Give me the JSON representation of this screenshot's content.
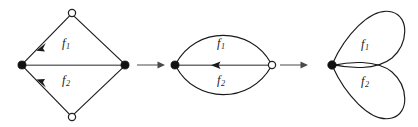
{
  "figure": {
    "caption": "",
    "background_color": "#ffffff",
    "diagrams": [
      {
        "id": "diamond-graph",
        "shape": "rhombus",
        "labels": {
          "top": "f",
          "top_sub": "1",
          "bottom": "f",
          "bottom_sub": "2"
        },
        "vertices": [
          {
            "name": "left-vertex",
            "style": "solid",
            "x": 22,
            "y": 65
          },
          {
            "name": "right-vertex",
            "style": "solid",
            "x": 125,
            "y": 65
          },
          {
            "name": "top-vertex",
            "style": "hollow",
            "x": 72,
            "y": 13
          },
          {
            "name": "bottom-vertex",
            "style": "hollow",
            "x": 72,
            "y": 117
          }
        ],
        "edges": [
          {
            "name": "edge-top-left",
            "color": "#1a1a1a",
            "arrow": "toward-left-vertex"
          },
          {
            "name": "edge-top-right",
            "color": "#1a1a1a",
            "arrow": "none"
          },
          {
            "name": "edge-bottom-left",
            "color": "#1a1a1a",
            "arrow": "toward-left-vertex"
          },
          {
            "name": "edge-bottom-right",
            "color": "#1a1a1a",
            "arrow": "none"
          },
          {
            "name": "edge-horizontal",
            "color": "#6f6f6f",
            "arrow": "none"
          }
        ]
      },
      {
        "id": "lens-graph",
        "shape": "bigon",
        "labels": {
          "top": "f",
          "top_sub": "1",
          "bottom": "f",
          "bottom_sub": "2"
        },
        "vertices": [
          {
            "name": "left-vertex",
            "style": "solid",
            "x": 175,
            "y": 65
          },
          {
            "name": "right-vertex",
            "style": "hollow",
            "x": 272,
            "y": 65
          }
        ],
        "edges": [
          {
            "name": "arc-upper",
            "color": "#1a1a1a",
            "arrow": "none"
          },
          {
            "name": "arc-lower",
            "color": "#1a1a1a",
            "arrow": "none"
          },
          {
            "name": "edge-horizontal",
            "color": "#4a4a4a",
            "arrow": "toward-left-vertex"
          }
        ]
      },
      {
        "id": "wedge-of-loops-graph",
        "shape": "bouquet",
        "labels": {
          "top": "f",
          "top_sub": "1",
          "bottom": "f",
          "bottom_sub": "2"
        },
        "vertices": [
          {
            "name": "base-vertex",
            "style": "solid",
            "x": 332,
            "y": 65
          }
        ],
        "edges": [
          {
            "name": "loop-upper",
            "color": "#1a1a1a",
            "arrow": "none"
          },
          {
            "name": "loop-lower",
            "color": "#1a1a1a",
            "arrow": "none"
          }
        ]
      }
    ],
    "map_arrows": [
      {
        "name": "map-arrow-1",
        "glyph": "→",
        "x": 150,
        "y": 65,
        "color": "#7a7a7a"
      },
      {
        "name": "map-arrow-2",
        "glyph": "→",
        "x": 293,
        "y": 65,
        "color": "#7a7a7a"
      }
    ]
  }
}
